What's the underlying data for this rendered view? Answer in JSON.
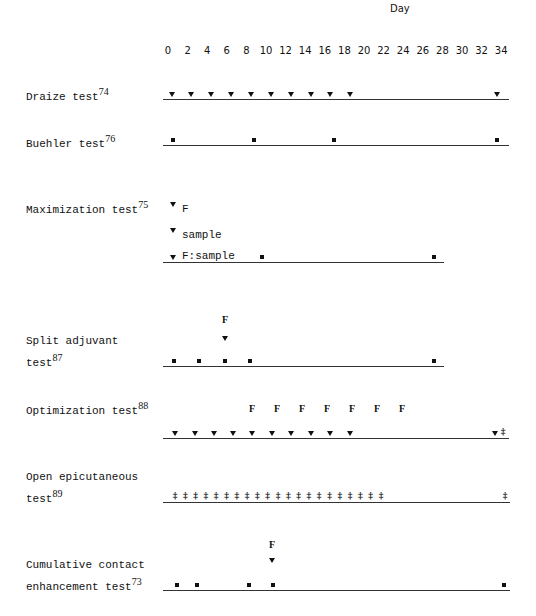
{
  "axis": {
    "title": "Day",
    "ticks": [
      "0",
      "2",
      "4",
      "6",
      "8",
      "10",
      "12",
      "14",
      "16",
      "18",
      "20",
      "22",
      "24",
      "26",
      "28",
      "30",
      "32",
      "34"
    ]
  },
  "legend_symbols": {
    "triangle": "induction/exposure (▼)",
    "square": "application (■)",
    "double_dagger": "‡",
    "F": "F"
  },
  "rows": [
    {
      "name": "Draize test",
      "ref": "74",
      "label_lines": [
        "Draize test"
      ]
    },
    {
      "name": "Buehler test",
      "ref": "76",
      "label_lines": [
        "Buehler test"
      ]
    },
    {
      "name": "Maximization test",
      "ref": "75",
      "label_lines": [
        "Maximization test"
      ],
      "annotations": [
        "F",
        "sample",
        "F:sample"
      ]
    },
    {
      "name": "Split adjuvant test",
      "ref": "87",
      "label_lines": [
        "Split adjuvant",
        "test"
      ],
      "annotations": [
        "F"
      ]
    },
    {
      "name": "Optimization test",
      "ref": "88",
      "label_lines": [
        "Optimization test"
      ],
      "annotations": [
        "F",
        "F",
        "F",
        "F",
        "F",
        "F",
        "F"
      ]
    },
    {
      "name": "Open epicutaneous test",
      "ref": "89",
      "label_lines": [
        "Open epicutaneous",
        "test"
      ]
    },
    {
      "name": "Cumulative contact enhancement test",
      "ref": "73",
      "label_lines": [
        "Cumulative contact",
        "enhancement test"
      ],
      "annotations": [
        "F"
      ]
    }
  ],
  "chart_data": {
    "type": "timeline",
    "title": "",
    "xlabel": "Day",
    "xlim": [
      0,
      34
    ],
    "x_ticks": [
      0,
      2,
      4,
      6,
      8,
      10,
      12,
      14,
      16,
      18,
      20,
      22,
      24,
      26,
      28,
      30,
      32,
      34
    ],
    "series": [
      {
        "name": "Draize test",
        "ref": "74",
        "triangle_days": [
          0,
          2,
          4,
          6,
          8,
          10,
          12,
          14,
          16,
          18,
          34
        ]
      },
      {
        "name": "Buehler test",
        "ref": "76",
        "square_days": [
          0,
          8,
          16,
          32
        ]
      },
      {
        "name": "Maximization test",
        "ref": "75",
        "triangle_days": [
          0
        ],
        "triangle_labels": [
          "F",
          "sample",
          "F:sample"
        ],
        "square_days": [
          9,
          27
        ]
      },
      {
        "name": "Split adjuvant test",
        "ref": "87",
        "square_days": [
          0,
          2,
          4,
          7,
          27
        ],
        "triangle_days": [
          4
        ],
        "F_days": [
          4
        ]
      },
      {
        "name": "Optimization test",
        "ref": "88",
        "triangle_days": [
          0,
          2,
          4,
          6,
          8,
          10,
          12,
          14,
          16,
          18,
          34
        ],
        "F_days": [
          8,
          10,
          12,
          14,
          16,
          18,
          20
        ],
        "double_dagger_days": [
          35
        ]
      },
      {
        "name": "Open epicutaneous test",
        "ref": "89",
        "double_dagger_days": [
          0,
          1,
          2,
          3,
          4,
          5,
          6,
          7,
          8,
          9,
          10,
          11,
          12,
          13,
          14,
          15,
          16,
          17,
          18,
          19,
          20,
          35
        ]
      },
      {
        "name": "Cumulative contact enhancement test",
        "ref": "73",
        "square_days": [
          0,
          2,
          7,
          9,
          35
        ],
        "triangle_days": [
          9
        ],
        "F_days": [
          9
        ]
      }
    ]
  }
}
